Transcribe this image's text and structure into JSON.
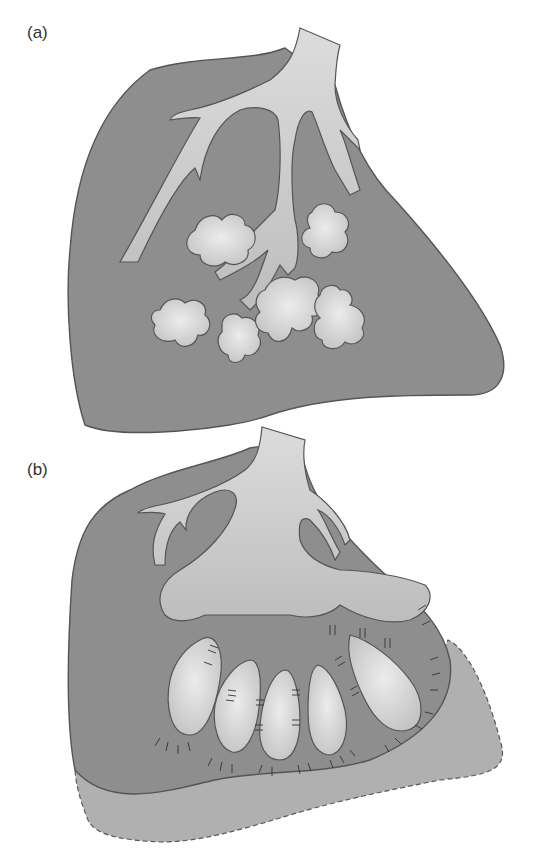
{
  "panels": [
    {
      "id": "a",
      "label": "(a)",
      "description": "Lobule with bronchial tree ending in lobulated acinar buds"
    },
    {
      "id": "b",
      "label": "(b)",
      "description": "Lobule with bronchial tree ending in club-shaped elongated alveolar buds, expanded lower margin (dashed outline)"
    }
  ],
  "colors": {
    "parenchyma": "#8c8c8c",
    "airway": "#c6c6c6",
    "airway_light": "#e2e2e2",
    "outline": "#5a5a5a",
    "expansion": "#b2b2b2"
  }
}
